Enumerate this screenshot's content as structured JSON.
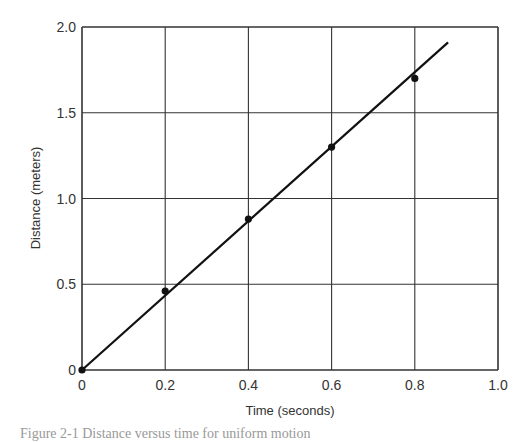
{
  "chart_data": {
    "type": "scatter",
    "title": "",
    "xlabel": "Time (seconds)",
    "ylabel": "Distance (meters)",
    "xlim": [
      0,
      1.0
    ],
    "ylim": [
      0,
      2.0
    ],
    "x_ticks": [
      "0",
      "0.2",
      "0.4",
      "0.6",
      "0.8",
      "1.0"
    ],
    "y_ticks": [
      "0",
      "0.5",
      "1.0",
      "1.5",
      "2.0"
    ],
    "grid": true,
    "legend": null,
    "series": [
      {
        "name": "Measured points",
        "x": [
          0,
          0.2,
          0.4,
          0.6,
          0.8
        ],
        "y": [
          0,
          0.46,
          0.88,
          1.3,
          1.7
        ]
      }
    ],
    "fit_line": {
      "name": "Best-fit line",
      "x": [
        0,
        0.88
      ],
      "y": [
        0,
        1.91
      ]
    }
  },
  "caption": "Figure 2-1  Distance versus time for uniform motion"
}
